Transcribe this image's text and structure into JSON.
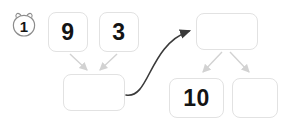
{
  "diagram": {
    "step_badge": {
      "icon": "bear-face-badge-icon",
      "value": "1"
    },
    "nodes": [
      {
        "id": "operand-left",
        "label": "9",
        "x": 48,
        "y": 12,
        "w": 40,
        "h": 40
      },
      {
        "id": "operand-right",
        "label": "3",
        "x": 99,
        "y": 12,
        "w": 40,
        "h": 40
      },
      {
        "id": "result-empty",
        "label": "",
        "x": 63,
        "y": 74,
        "w": 62,
        "h": 37
      },
      {
        "id": "target-empty",
        "label": "",
        "x": 196,
        "y": 13,
        "w": 62,
        "h": 37
      },
      {
        "id": "output-ten",
        "label": "10",
        "x": 169,
        "y": 78,
        "w": 55,
        "h": 40
      },
      {
        "id": "output-empty",
        "label": "",
        "x": 232,
        "y": 78,
        "w": 46,
        "h": 40
      }
    ],
    "colors": {
      "node_border": "#e2e2e2",
      "node_fill": "#ffffff",
      "label_text": "#141414",
      "light_arrow": "#d2d2d2",
      "dark_arrow": "#3a3a3a",
      "badge_outline": "#8c8c8c",
      "background": "#ffffff"
    },
    "edges": [
      {
        "id": "edge-9-to-result",
        "from": "operand-left",
        "to": "result-empty",
        "style": "light"
      },
      {
        "id": "edge-3-to-result",
        "from": "operand-right",
        "to": "result-empty",
        "style": "light"
      },
      {
        "id": "edge-result-to-target",
        "from": "result-empty",
        "to": "target-empty",
        "style": "dark-curved"
      },
      {
        "id": "edge-target-to-ten",
        "from": "target-empty",
        "to": "output-ten",
        "style": "light"
      },
      {
        "id": "edge-target-to-empty",
        "from": "target-empty",
        "to": "output-empty",
        "style": "light"
      }
    ]
  }
}
